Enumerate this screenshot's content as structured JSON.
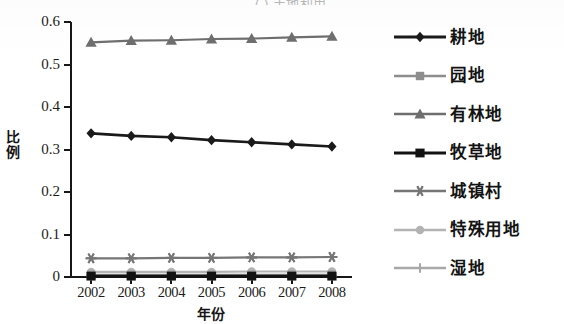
{
  "figure": {
    "title_fragment": "( ) 土地利用",
    "background_color": "#ffffff"
  },
  "axes": {
    "y_title": "比例",
    "x_title": "年份",
    "y_ticks": [
      "0",
      "0.1",
      "0.2",
      "0.3",
      "0.4",
      "0.5",
      "0.6"
    ],
    "x_ticks": [
      "2002",
      "2003",
      "2004",
      "2005",
      "2006",
      "2007",
      "2008"
    ]
  },
  "legend": {
    "items": [
      {
        "label": "耕地",
        "marker": "diamond-marker",
        "color": "#1a1a1a"
      },
      {
        "label": "园地",
        "marker": "square-marker",
        "color": "#8d8d8d"
      },
      {
        "label": "有林地",
        "marker": "triangle-marker",
        "color": "#6e6e6e"
      },
      {
        "label": "牧草地",
        "marker": "filled-square-marker",
        "color": "#121212"
      },
      {
        "label": "城镇村",
        "marker": "asterisk-marker",
        "color": "#767676"
      },
      {
        "label": "特殊用地",
        "marker": "circle-marker",
        "color": "#b3b3b3"
      },
      {
        "label": "湿地",
        "marker": "plus-marker",
        "color": "#a8a8a8"
      }
    ]
  },
  "chart_data": {
    "type": "line",
    "title": "( ) 土地利用",
    "xlabel": "年份",
    "ylabel": "比例",
    "categories": [
      "2002",
      "2003",
      "2004",
      "2005",
      "2006",
      "2007",
      "2008"
    ],
    "ylim": [
      0,
      0.6
    ],
    "ytick_step": 0.1,
    "grid": false,
    "legend_position": "right",
    "series": [
      {
        "name": "耕地",
        "marker": "diamond",
        "color": "#1a1a1a",
        "values": [
          0.338,
          0.332,
          0.329,
          0.322,
          0.317,
          0.312,
          0.307
        ]
      },
      {
        "name": "园地",
        "marker": "square",
        "color": "#8d8d8d",
        "values": [
          0.005,
          0.005,
          0.005,
          0.005,
          0.005,
          0.005,
          0.005
        ]
      },
      {
        "name": "有林地",
        "marker": "triangle",
        "color": "#6e6e6e",
        "values": [
          0.552,
          0.556,
          0.557,
          0.56,
          0.561,
          0.564,
          0.566
        ]
      },
      {
        "name": "牧草地",
        "marker": "filled-square",
        "color": "#121212",
        "values": [
          0.002,
          0.002,
          0.002,
          0.002,
          0.002,
          0.002,
          0.002
        ]
      },
      {
        "name": "城镇村",
        "marker": "asterisk",
        "color": "#767676",
        "values": [
          0.044,
          0.044,
          0.045,
          0.045,
          0.046,
          0.046,
          0.047
        ]
      },
      {
        "name": "特殊用地",
        "marker": "circle",
        "color": "#b3b3b3",
        "values": [
          0.012,
          0.012,
          0.012,
          0.012,
          0.013,
          0.013,
          0.013
        ]
      },
      {
        "name": "湿地",
        "marker": "plus",
        "color": "#a8a8a8",
        "values": [
          0.003,
          0.003,
          0.003,
          0.003,
          0.003,
          0.003,
          0.003
        ]
      }
    ]
  }
}
